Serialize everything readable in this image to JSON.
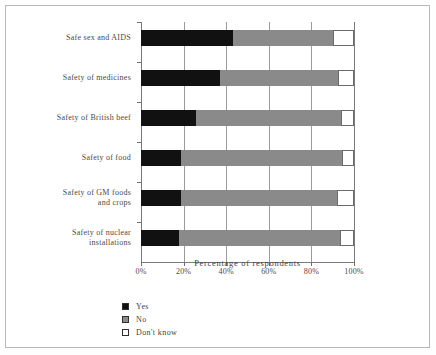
{
  "chart_data": {
    "type": "bar",
    "subtype": "stacked-horizontal-bar",
    "title": "",
    "xlabel": "Percentage  of  respondents",
    "ylabel": "",
    "xlim": [
      0,
      100
    ],
    "xticks": [
      "0%",
      "20%",
      "40%",
      "60%",
      "80%",
      "100%"
    ],
    "xtick_values": [
      0,
      20,
      40,
      60,
      80,
      100
    ],
    "grid": true,
    "grid_axis": "x",
    "legend_position": "bottom-left",
    "categories": [
      "Safe sex and AIDS",
      "Safety of medicines",
      "Safety of British beef",
      "Safety of food",
      "Safety of GM foods\nand crops",
      "Safety of nuclear\ninstallations"
    ],
    "series": [
      {
        "name": "Yes",
        "color": "#111111",
        "values": [
          43,
          37,
          26,
          19,
          19,
          18
        ]
      },
      {
        "name": "No",
        "color": "#8a8a8a",
        "values": [
          47,
          55.5,
          68,
          75.5,
          73,
          75.5
        ]
      },
      {
        "name": "Don't know",
        "color": "#ffffff",
        "values": [
          10,
          7.5,
          6,
          5.5,
          8,
          6.5
        ]
      }
    ]
  },
  "legend": {
    "items": [
      {
        "label": "Yes",
        "swatch": "black-square-icon"
      },
      {
        "label": "No",
        "swatch": "gray-square-icon"
      },
      {
        "label": "Don't know",
        "swatch": "white-square-icon"
      }
    ]
  },
  "colors": {
    "yes": "#111111",
    "no": "#8a8a8a",
    "dont_know": "#ffffff",
    "frame": "#b8b8b8",
    "axis": "#7a7a7a",
    "gridline": "#9a9a9a",
    "text": "#4a4a4a"
  }
}
